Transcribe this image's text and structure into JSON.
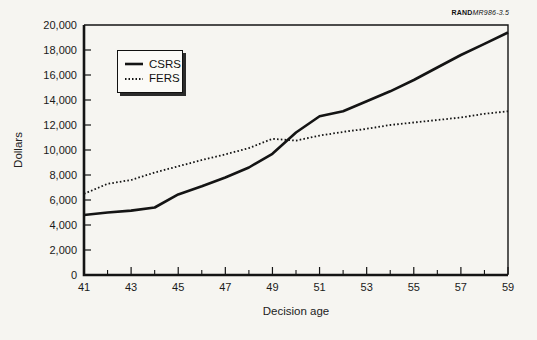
{
  "source_label": {
    "publisher": "RAND",
    "id": "MR986-3.5"
  },
  "chart_data": {
    "type": "line",
    "title": "",
    "xlabel": "Decision age",
    "ylabel": "Dollars",
    "x": [
      41,
      42,
      43,
      44,
      45,
      46,
      47,
      48,
      49,
      50,
      51,
      52,
      53,
      54,
      55,
      56,
      57,
      58,
      59
    ],
    "xlim": [
      41,
      59
    ],
    "ylim": [
      0,
      20000
    ],
    "x_major_ticks": [
      41,
      43,
      45,
      47,
      49,
      51,
      53,
      55,
      57,
      59
    ],
    "x_minor_ticks": [
      42,
      44,
      46,
      48,
      50,
      52,
      54,
      56,
      58
    ],
    "y_ticks": [
      0,
      2000,
      4000,
      6000,
      8000,
      10000,
      12000,
      14000,
      16000,
      18000,
      20000
    ],
    "grid": false,
    "legend_position": "top-left-inside",
    "series": [
      {
        "name": "CSRS",
        "style": "solid",
        "color": "#141414",
        "values": [
          4800,
          5000,
          5150,
          5400,
          6450,
          7100,
          7800,
          8600,
          9700,
          11400,
          12700,
          13100,
          13900,
          14700,
          15600,
          16600,
          17600,
          18500,
          19400
        ]
      },
      {
        "name": "FERS",
        "style": "dotted",
        "color": "#141414",
        "values": [
          6500,
          7300,
          7600,
          8200,
          8700,
          9200,
          9650,
          10150,
          10900,
          10750,
          11150,
          11450,
          11700,
          12000,
          12200,
          12400,
          12600,
          12900,
          13100
        ]
      }
    ]
  }
}
